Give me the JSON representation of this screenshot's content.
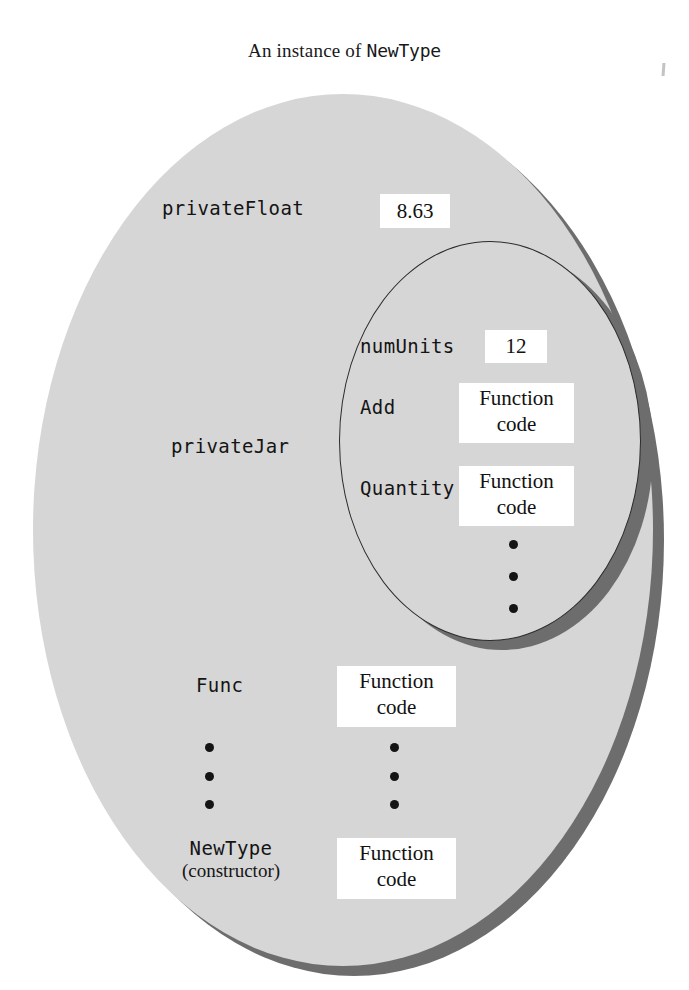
{
  "title": {
    "prefix": "An instance of ",
    "type_name": "NewType"
  },
  "colors": {
    "ellipse_fill": "#d6d6d6",
    "ellipse_shadow": "#6d6d6d",
    "outline": "#2b2b2b",
    "box_fill": "#ffffff",
    "text": "#141414",
    "page_background": "#ffffff"
  },
  "outer_object": {
    "name": "outer-instance-ellipse",
    "members": [
      {
        "label": "privateFloat",
        "value": "8.63",
        "value_kind": "scalar"
      },
      {
        "label": "privateJar",
        "value": "",
        "value_kind": "nested-object"
      },
      {
        "label": "Func",
        "value_line1": "Function",
        "value_line2": "code",
        "value_kind": "function"
      },
      {
        "label": "NewType",
        "sublabel": "(constructor)",
        "value_line1": "Function",
        "value_line2": "code",
        "value_kind": "function"
      }
    ],
    "ellipsis": "⋮"
  },
  "inner_object": {
    "name": "privateJar-ellipse",
    "members": [
      {
        "label": "numUnits",
        "value": "12",
        "value_kind": "scalar"
      },
      {
        "label": "Add",
        "value_line1": "Function",
        "value_line2": "code",
        "value_kind": "function"
      },
      {
        "label": "Quantity",
        "value_line1": "Function",
        "value_line2": "code",
        "value_kind": "function"
      }
    ],
    "ellipsis": "⋮"
  }
}
